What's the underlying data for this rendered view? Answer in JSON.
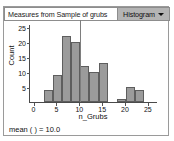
{
  "window": {
    "title": "Measures from Sample of grubs",
    "plot_type": "Histogram",
    "caret_icon": "chevron-down-icon"
  },
  "footer": {
    "mean_text": "mean ( ) = 10.0"
  },
  "chart_data": {
    "type": "bar",
    "title": "Measures from Sample of grubs",
    "xlabel": "n_Grubs",
    "ylabel": "Count",
    "xlim": [
      -1,
      27
    ],
    "ylim": [
      0,
      26
    ],
    "xticks": [
      0,
      5,
      10,
      15,
      20,
      25
    ],
    "yticks": [
      5,
      10,
      15,
      20,
      25
    ],
    "grid": false,
    "legend": "none",
    "bin_width": 2,
    "bin_starts": [
      2,
      4,
      6,
      8,
      10,
      12,
      14,
      18,
      20,
      22
    ],
    "categories": [
      "2-4",
      "4-6",
      "6-8",
      "8-10",
      "10-12",
      "12-14",
      "14-16",
      "18-20",
      "20-22",
      "22-24"
    ],
    "values": [
      4,
      9,
      22,
      20,
      12,
      10,
      13,
      1,
      5,
      4
    ],
    "annotations": [
      {
        "name": "mean-reference-line",
        "x": 10,
        "label": "mean ( ) = 10.0"
      }
    ],
    "colors": {
      "bar_fill": "#9b9b9b",
      "bar_edge": "#5e5e5e",
      "axis": "#4a4a4a",
      "reference_line": "#7e7e7e"
    }
  }
}
